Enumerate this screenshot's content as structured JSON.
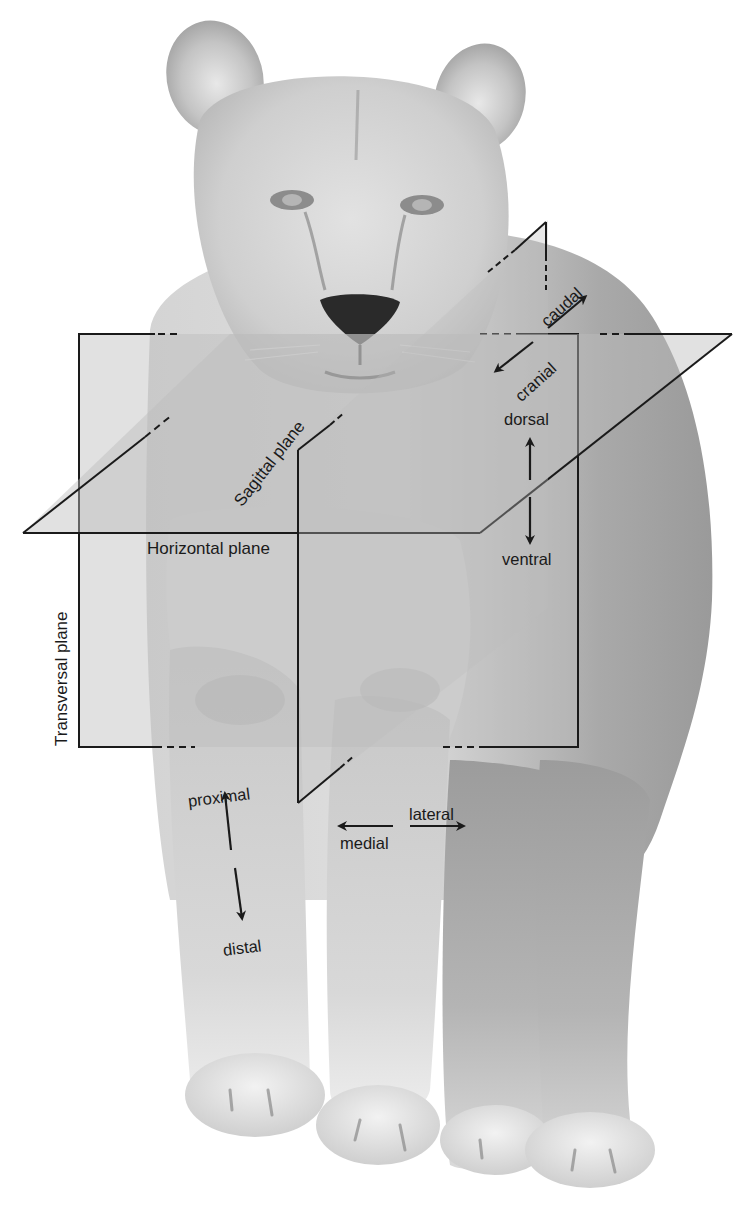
{
  "figure": {
    "background_color": "#ffffff",
    "plane_fill": "#bdbdbd",
    "line_color": "#1a1a1a"
  },
  "planes": {
    "transversal": {
      "label": "Transversal plane"
    },
    "sagittal": {
      "label": "Sagittal plane"
    },
    "horizontal": {
      "label": "Horizontal plane"
    }
  },
  "directions": {
    "caudal": {
      "label": "caudal"
    },
    "cranial": {
      "label": "cranial"
    },
    "dorsal": {
      "label": "dorsal"
    },
    "ventral": {
      "label": "ventral"
    },
    "proximal": {
      "label": "proximal"
    },
    "distal": {
      "label": "distal"
    },
    "medial": {
      "label": "medial"
    },
    "lateral": {
      "label": "lateral"
    }
  }
}
